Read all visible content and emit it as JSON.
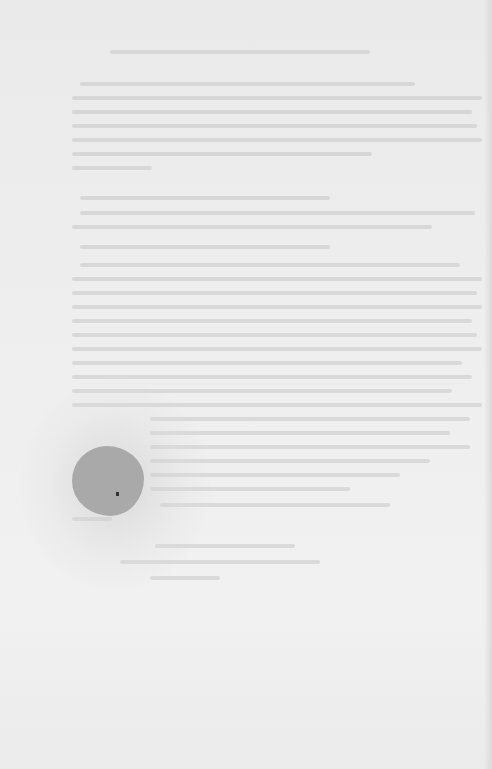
{
  "document": {
    "type": "scanned-page",
    "legibility": "text too faded to transcribe",
    "background_color": "#ececec",
    "blot_color": "#a9a9a9"
  },
  "text_lines": [
    {
      "x": 110,
      "y": 50,
      "w": 260
    },
    {
      "x": 80,
      "y": 82,
      "w": 335
    },
    {
      "x": 72,
      "y": 96,
      "w": 410
    },
    {
      "x": 72,
      "y": 110,
      "w": 400
    },
    {
      "x": 72,
      "y": 124,
      "w": 405
    },
    {
      "x": 72,
      "y": 138,
      "w": 410
    },
    {
      "x": 72,
      "y": 152,
      "w": 300
    },
    {
      "x": 72,
      "y": 166,
      "w": 80
    },
    {
      "x": 80,
      "y": 196,
      "w": 250
    },
    {
      "x": 80,
      "y": 211,
      "w": 395
    },
    {
      "x": 72,
      "y": 225,
      "w": 360
    },
    {
      "x": 80,
      "y": 245,
      "w": 250
    },
    {
      "x": 80,
      "y": 263,
      "w": 380
    },
    {
      "x": 72,
      "y": 277,
      "w": 410
    },
    {
      "x": 72,
      "y": 291,
      "w": 405
    },
    {
      "x": 72,
      "y": 305,
      "w": 410
    },
    {
      "x": 72,
      "y": 319,
      "w": 400
    },
    {
      "x": 72,
      "y": 333,
      "w": 405
    },
    {
      "x": 72,
      "y": 347,
      "w": 410
    },
    {
      "x": 72,
      "y": 361,
      "w": 390
    },
    {
      "x": 72,
      "y": 375,
      "w": 400
    },
    {
      "x": 72,
      "y": 389,
      "w": 380
    },
    {
      "x": 72,
      "y": 403,
      "w": 410
    },
    {
      "x": 150,
      "y": 417,
      "w": 320
    },
    {
      "x": 150,
      "y": 431,
      "w": 300
    },
    {
      "x": 150,
      "y": 445,
      "w": 320
    },
    {
      "x": 150,
      "y": 459,
      "w": 280
    },
    {
      "x": 150,
      "y": 473,
      "w": 250
    },
    {
      "x": 150,
      "y": 487,
      "w": 200
    },
    {
      "x": 160,
      "y": 503,
      "w": 230
    },
    {
      "x": 72,
      "y": 517,
      "w": 40
    },
    {
      "x": 155,
      "y": 544,
      "w": 140
    },
    {
      "x": 120,
      "y": 560,
      "w": 200
    },
    {
      "x": 150,
      "y": 576,
      "w": 70
    }
  ]
}
